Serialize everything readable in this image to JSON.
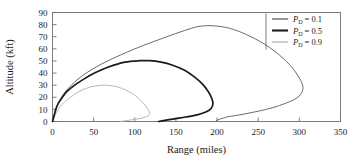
{
  "chart_data": {
    "type": "line",
    "title": "",
    "xlabel": "Range (miles)",
    "ylabel": "Altitude (kft)",
    "xlim": [
      0,
      350
    ],
    "ylim": [
      0,
      90
    ],
    "xticks": [
      0,
      50,
      100,
      150,
      200,
      250,
      300,
      350
    ],
    "yticks": [
      0,
      10,
      20,
      30,
      40,
      50,
      60,
      70,
      80,
      90
    ],
    "xtick_labels": [
      "0",
      "50",
      "100",
      "150",
      "200",
      "250",
      "300",
      "350"
    ],
    "ytick_labels": [
      "0",
      "10",
      "20",
      "30",
      "40",
      "50",
      "60",
      "70",
      "80",
      "90"
    ],
    "grid": false,
    "legend_position": "upper right",
    "series": [
      {
        "name": "P_D = 0.1",
        "label_base": "P",
        "label_sub": "D",
        "label_value": "= 0.1",
        "color": "#6b6b6b",
        "width": 1.0,
        "points": [
          [
            0,
            0
          ],
          [
            2,
            5
          ],
          [
            4,
            10
          ],
          [
            7,
            15
          ],
          [
            11,
            20
          ],
          [
            16,
            25
          ],
          [
            23,
            30
          ],
          [
            31,
            35
          ],
          [
            41,
            40
          ],
          [
            53,
            45
          ],
          [
            67,
            50
          ],
          [
            83,
            55
          ],
          [
            100,
            60
          ],
          [
            119,
            65
          ],
          [
            139,
            70
          ],
          [
            160,
            75
          ],
          [
            178,
            78.5
          ],
          [
            196,
            79
          ],
          [
            215,
            77
          ],
          [
            235,
            72
          ],
          [
            255,
            65
          ],
          [
            272,
            57
          ],
          [
            288,
            47
          ],
          [
            298,
            38
          ],
          [
            304,
            30
          ],
          [
            303,
            24
          ],
          [
            296,
            19
          ],
          [
            283,
            15
          ],
          [
            268,
            11.5
          ],
          [
            250,
            8.5
          ],
          [
            232,
            6
          ],
          [
            214,
            4
          ],
          [
            206,
            2.5
          ],
          [
            200,
            1
          ],
          [
            198,
            0
          ]
        ]
      },
      {
        "name": "P_D = 0.5",
        "label_base": "P",
        "label_sub": "D",
        "label_value": "= 0.5",
        "color": "#1a1a1a",
        "width": 1.7,
        "points": [
          [
            0,
            0
          ],
          [
            2,
            5
          ],
          [
            4,
            10
          ],
          [
            7,
            15
          ],
          [
            12,
            20
          ],
          [
            18,
            25
          ],
          [
            27,
            30
          ],
          [
            38,
            35
          ],
          [
            51,
            40
          ],
          [
            68,
            45
          ],
          [
            88,
            49
          ],
          [
            106,
            50.2
          ],
          [
            118,
            50.2
          ],
          [
            132,
            49
          ],
          [
            146,
            46.5
          ],
          [
            160,
            42.5
          ],
          [
            172,
            37
          ],
          [
            182,
            31
          ],
          [
            189,
            25
          ],
          [
            193,
            20
          ],
          [
            195,
            15
          ],
          [
            193,
            11
          ],
          [
            187,
            8
          ],
          [
            176,
            5.5
          ],
          [
            162,
            3.7
          ],
          [
            150,
            2.4
          ],
          [
            140,
            1.3
          ],
          [
            133,
            0.5
          ],
          [
            129,
            0
          ]
        ]
      },
      {
        "name": "P_D = 0.9",
        "label_base": "P",
        "label_sub": "D",
        "label_value": "= 0.9",
        "color": "#b8b8b8",
        "width": 1.0,
        "points": [
          [
            0,
            0
          ],
          [
            3,
            5
          ],
          [
            7,
            10
          ],
          [
            13,
            15
          ],
          [
            22,
            20
          ],
          [
            33,
            25
          ],
          [
            46,
            28.5
          ],
          [
            58,
            29.8
          ],
          [
            68,
            29.8
          ],
          [
            79,
            28.5
          ],
          [
            89,
            26
          ],
          [
            97,
            23
          ],
          [
            104,
            19.5
          ],
          [
            110,
            15.5
          ],
          [
            114,
            12
          ],
          [
            117,
            9
          ],
          [
            118,
            6.5
          ],
          [
            116,
            4.7
          ],
          [
            111,
            3.3
          ],
          [
            104,
            2.2
          ],
          [
            96,
            1.4
          ],
          [
            90,
            0.8
          ],
          [
            85,
            0.3
          ],
          [
            82,
            0
          ]
        ]
      }
    ]
  },
  "legend": {
    "entries": [
      {
        "label_base": "P",
        "label_sub": "D",
        "label_value": "= 0.1"
      },
      {
        "label_base": "P",
        "label_sub": "D",
        "label_value": "= 0.5"
      },
      {
        "label_base": "P",
        "label_sub": "D",
        "label_value": "= 0.9"
      }
    ]
  }
}
